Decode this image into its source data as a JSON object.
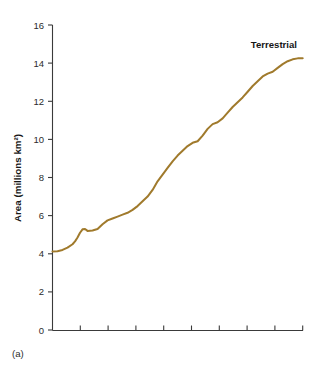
{
  "figure": {
    "panel_label": "(a)",
    "background_color": "#ffffff"
  },
  "chart_data": {
    "type": "line",
    "title": "",
    "xlabel": "",
    "ylabel": "Area (millions km²)",
    "ylim": [
      0,
      16
    ],
    "yticks": [
      0,
      2,
      4,
      6,
      8,
      10,
      12,
      14,
      16
    ],
    "ytick_labels": [
      "0",
      "2",
      "4",
      "6",
      "8",
      "10",
      "12",
      "14",
      "16"
    ],
    "xlim": [
      0,
      100
    ],
    "xticks": [
      0,
      11.1,
      22.2,
      33.3,
      44.4,
      55.6,
      66.7,
      77.8,
      88.9,
      100
    ],
    "xtick_labels": [
      "",
      "",
      "",
      "",
      "",
      "",
      "",
      "",
      "",
      ""
    ],
    "grid": false,
    "legend_position": "inline-right",
    "series": [
      {
        "name": "Terrestrial",
        "color": "#a07a2c",
        "annotation": "Terrestrial",
        "x": [
          0,
          2,
          4,
          6,
          8,
          9,
          10,
          11,
          12,
          13,
          14,
          16,
          18,
          20,
          22,
          24,
          26,
          28,
          30,
          32,
          34,
          36,
          38,
          40,
          42,
          44,
          46,
          48,
          50,
          52,
          54,
          56,
          58,
          60,
          62,
          64,
          66,
          68,
          70,
          72,
          74,
          76,
          78,
          80,
          82,
          84,
          86,
          88,
          90,
          92,
          94,
          96,
          98,
          100
        ],
        "values": [
          4.12,
          4.13,
          4.2,
          4.32,
          4.5,
          4.65,
          4.85,
          5.1,
          5.28,
          5.3,
          5.2,
          5.22,
          5.3,
          5.55,
          5.75,
          5.85,
          5.95,
          6.05,
          6.15,
          6.3,
          6.5,
          6.75,
          7.0,
          7.35,
          7.8,
          8.15,
          8.5,
          8.85,
          9.15,
          9.4,
          9.65,
          9.82,
          9.9,
          10.2,
          10.55,
          10.8,
          10.9,
          11.1,
          11.4,
          11.7,
          11.95,
          12.2,
          12.5,
          12.8,
          13.05,
          13.3,
          13.45,
          13.55,
          13.75,
          13.95,
          14.1,
          14.2,
          14.25,
          14.25
        ]
      }
    ]
  },
  "axis": {
    "line_color": "#3a3a3a"
  }
}
